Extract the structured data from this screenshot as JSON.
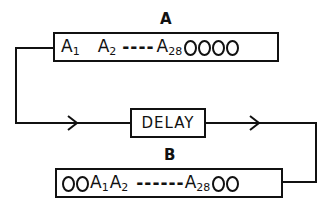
{
  "diagram": {
    "register_a": {
      "label": "A",
      "cells": {
        "first": "A",
        "first_sub": "1",
        "second": "A",
        "second_sub": "2",
        "ellipsis": "----",
        "last": "A",
        "last_sub": "28"
      },
      "trailing_empty_slots": 4
    },
    "delay": {
      "label": "DELAY"
    },
    "register_b": {
      "label": "B",
      "leading_empty_slots": 2,
      "cells": {
        "first": "A",
        "first_sub": "1",
        "second": "A",
        "second_sub": "2",
        "ellipsis": "------",
        "last": "A",
        "last_sub": "28"
      },
      "trailing_empty_slots": 2
    },
    "flow": [
      "A",
      "DELAY",
      "B"
    ]
  }
}
